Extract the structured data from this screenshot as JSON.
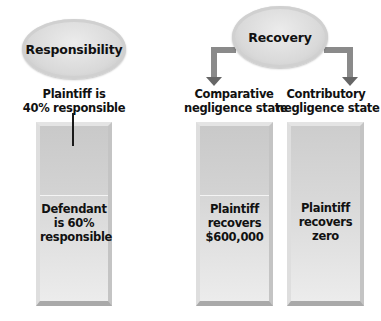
{
  "responsibility": {
    "title": "Responsibility",
    "plaintiff_label_line1": "Plaintiff is",
    "plaintiff_label_line2": "40% responsible",
    "plaintiff_share_pct": 40,
    "defendant_line1": "Defendant",
    "defendant_line2": "is 60%",
    "defendant_line3": "responsible",
    "defendant_share_pct": 60
  },
  "recovery": {
    "title": "Recovery",
    "comparative": {
      "label_line1": "Comparative",
      "label_line2": "negligence state",
      "result_line1": "Plaintiff",
      "result_line2": "recovers",
      "result_line3": "$600,000"
    },
    "contributory": {
      "label_line1": "Contributory",
      "label_line2": "negligence state",
      "result_line1": "Plaintiff",
      "result_line2": "recovers",
      "result_line3": "zero"
    }
  },
  "colors": {
    "ellipse_fill": "#d9d9d9",
    "column_fill": "#cfcfcf",
    "arrow": "#6e6e6e",
    "text": "#111111"
  }
}
